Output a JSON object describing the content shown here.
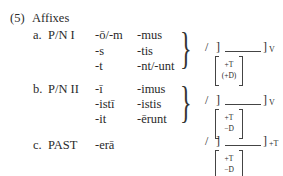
{
  "example": {
    "number": "(5)",
    "title": "Affixes",
    "sections": [
      {
        "letter": "a.",
        "label": "P/N I",
        "col1": [
          "-ō/-m",
          "-s",
          "-t"
        ],
        "col2": [
          "-mus",
          "-tis",
          "-nt/-unt"
        ],
        "rule": {
          "slash": "/",
          "left_bracket": "]",
          "right_bracket": "]",
          "subscript": "V",
          "features": [
            "+T",
            "(+D)"
          ]
        }
      },
      {
        "letter": "b.",
        "label": "P/N II",
        "col1": [
          "-ī",
          "-istī",
          "-it"
        ],
        "col2": [
          "-imus",
          "-istis",
          "-ērunt"
        ],
        "rule": {
          "slash": "/",
          "left_bracket": "]",
          "right_bracket": "]",
          "subscript": "V",
          "features": [
            "+T",
            "−D"
          ]
        }
      },
      {
        "letter": "c.",
        "label": "PAST",
        "col1": [
          "-erā"
        ],
        "col2": [],
        "rule": {
          "slash": "/",
          "left_bracket": "]",
          "right_bracket": "]",
          "subscript": "+T",
          "features": [
            "+T",
            "−D"
          ]
        }
      }
    ]
  }
}
